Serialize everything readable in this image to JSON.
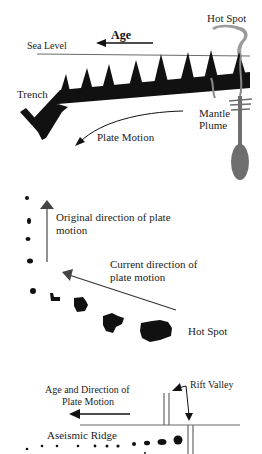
{
  "panel_top": {
    "labels": {
      "hot_spot": "Hot Spot",
      "age": "Age",
      "sea_level": "Sea Level",
      "trench": "Trench",
      "mantle_line1": "Mantle",
      "mantle_line2": "Plume",
      "plate_motion": "Plate Motion"
    },
    "colors": {
      "plate": "#111111",
      "plume": "#6e6e6e",
      "smoke": "#8a8a8a"
    }
  },
  "panel_middle": {
    "labels": {
      "original_line1": "Original direction of plate",
      "original_line2": "motion",
      "current_line1": "Current direction of",
      "current_line2": "plate motion",
      "hot_spot": "Hot Spot"
    },
    "colors": {
      "arrow": "#444444",
      "island": "#111111"
    }
  },
  "panel_bottom": {
    "labels": {
      "age_dir_line1": "Age and Direction of",
      "age_dir_line2": "Plate Motion",
      "rift_valley": "Rift Valley",
      "aseismic_ridge": "Aseismic Ridge"
    },
    "colors": {
      "lines": "#555555",
      "dots": "#111111"
    }
  }
}
